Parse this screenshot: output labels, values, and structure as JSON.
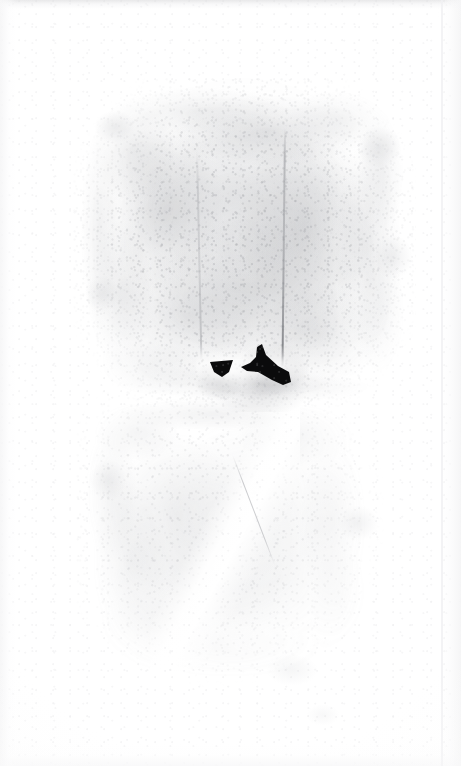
{
  "image": {
    "kind": "scanned-document-sheet",
    "width": 461,
    "height": 766,
    "alt_text": "Heavily faded scan of an aged paper sheet with a large mottled grey stain and a small dark ink mark near the center",
    "caption": ""
  },
  "palette": {
    "paper_white": "#ffffff",
    "paper_offwhite": "#fdfdfd",
    "stain_light": "#f2f2f3",
    "stain_mid": "#dcdce0",
    "stain_dark": "#9a9ca1",
    "crease_grey": "#6e7076",
    "ink_black": "#0b0b0c",
    "edge_grey": "#d6d6d8"
  },
  "regions": {
    "margin": {
      "label": "blank paper margin",
      "top_height": 78,
      "bottom_height": 76,
      "left_width": 72,
      "right_width": 45
    },
    "stain_upper": {
      "label": "upper mottled stain field",
      "x": 72,
      "y": 78,
      "width": 344,
      "height": 330,
      "density": "moderate"
    },
    "stain_lower": {
      "label": "lower mottled stain field",
      "x": 74,
      "y": 390,
      "width": 310,
      "height": 300,
      "density": "faint"
    }
  },
  "features": [
    {
      "name": "crease-right",
      "label": "vertical crease line, right",
      "x": 284,
      "y": 128,
      "length": 238,
      "tone": "#6e7076"
    },
    {
      "name": "crease-left",
      "label": "vertical crease line, left",
      "x": 196,
      "y": 150,
      "length": 210,
      "tone": "#8c8e94"
    },
    {
      "name": "fold-streak",
      "label": "bright diagonal fold highlight",
      "x": 150,
      "y": 400,
      "width": 150,
      "height": 300,
      "angle_deg": 118
    },
    {
      "name": "ink-mark",
      "label": "dark ink mark",
      "x": 200,
      "y": 338,
      "width": 100,
      "height": 54,
      "tone": "#0b0b0c"
    }
  ],
  "blotches": [
    {
      "name": "blotch-upper-left",
      "x": 86,
      "y": 104,
      "w": 58,
      "h": 46,
      "opacity": 0.16
    },
    {
      "name": "blotch-upper-right",
      "x": 348,
      "y": 118,
      "w": 62,
      "h": 58,
      "opacity": 0.18
    },
    {
      "name": "blotch-mid-right",
      "x": 366,
      "y": 226,
      "w": 54,
      "h": 62,
      "opacity": 0.15
    },
    {
      "name": "blotch-mid-left",
      "x": 78,
      "y": 268,
      "w": 48,
      "h": 52,
      "opacity": 0.14
    },
    {
      "name": "blotch-low-left",
      "x": 82,
      "y": 452,
      "w": 52,
      "h": 56,
      "opacity": 0.12
    },
    {
      "name": "blotch-low-right",
      "x": 330,
      "y": 498,
      "w": 56,
      "h": 50,
      "opacity": 0.12
    },
    {
      "name": "blotch-bottom",
      "x": 256,
      "y": 648,
      "w": 72,
      "h": 44,
      "opacity": 0.09
    },
    {
      "name": "blotch-bottom-far",
      "x": 300,
      "y": 700,
      "w": 46,
      "h": 30,
      "opacity": 0.07
    }
  ],
  "ink_mark": {
    "label": "dark ink mark",
    "parts": [
      {
        "name": "ink-blob-left",
        "shape": "small downward triangle",
        "path": "M10,24 L33,22 L29,34 L22,39 L14,34 Z"
      },
      {
        "name": "ink-blob-right",
        "shape": "angular hooked wedge",
        "path": "M62,6 L66,17 L78,28 L89,34 L91,44 L83,47 L72,42 L58,34 L47,33 L41,29 L50,25 L56,19 L57,9 Z"
      }
    ]
  }
}
